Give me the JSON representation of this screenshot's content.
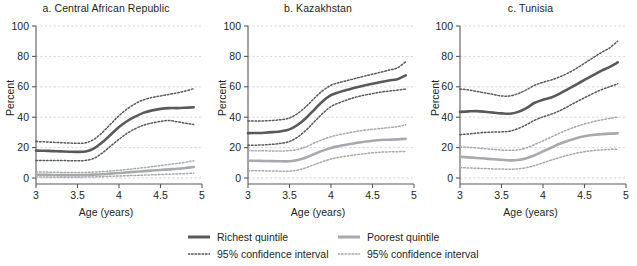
{
  "figure": {
    "ylabel": "Percent",
    "xlabel": "Age (years)",
    "xticks": [
      "3",
      "3.5",
      "4",
      "4.5",
      "5"
    ],
    "yticks": [
      "0",
      "20",
      "40",
      "60",
      "80",
      "100"
    ]
  },
  "legend": {
    "columns": [
      {
        "entries": [
          {
            "label": "Richest quintile",
            "style": "solid",
            "color": "#58595b"
          },
          {
            "label": "95% confidence interval",
            "style": "dotted",
            "color": "#58595b"
          }
        ]
      },
      {
        "entries": [
          {
            "label": "Poorest quintile",
            "style": "solid",
            "color": "#a7a9ac"
          },
          {
            "label": "95% confidence interval",
            "style": "dotted",
            "color": "#a7a9ac"
          }
        ]
      }
    ]
  },
  "colors": {
    "richest": "#58595b",
    "poorest": "#a7a9ac",
    "axis": "#58595b",
    "grid": "#c9c9d4",
    "text": "#231f20"
  },
  "chart_data": [
    {
      "type": "line",
      "title": "a. Central African Republic",
      "xlabel": "Age (years)",
      "ylabel": "Percent",
      "xlim": [
        3,
        5
      ],
      "ylim": [
        0,
        100
      ],
      "xticks": [
        3,
        3.5,
        4,
        4.5,
        5
      ],
      "yticks": [
        0,
        20,
        40,
        60,
        80,
        100
      ],
      "grid": true,
      "legend": "bottom",
      "x": [
        3.0,
        3.1,
        3.2,
        3.3,
        3.4,
        3.5,
        3.6,
        3.7,
        3.8,
        3.9,
        4.0,
        4.1,
        4.2,
        4.3,
        4.4,
        4.5,
        4.6,
        4.7,
        4.8,
        4.9
      ],
      "series": [
        {
          "name": "Richest quintile",
          "style": "solid",
          "color": "#58595b",
          "values": [
            18.0,
            17.9,
            17.7,
            17.5,
            17.3,
            17.2,
            17.5,
            19.5,
            23.5,
            28.5,
            33.5,
            37.5,
            40.5,
            43.0,
            44.5,
            45.5,
            46.0,
            46.0,
            46.2,
            46.5
          ]
        },
        {
          "name": "Richest quintile 95% CI upper",
          "style": "dotted",
          "color": "#58595b",
          "values": [
            24.0,
            23.8,
            23.5,
            23.2,
            23.0,
            22.8,
            23.2,
            25.5,
            30.0,
            35.5,
            41.0,
            45.5,
            49.0,
            51.5,
            53.0,
            54.0,
            55.0,
            56.0,
            57.2,
            58.8
          ]
        },
        {
          "name": "Richest quintile 95% CI lower",
          "style": "dotted",
          "color": "#58595b",
          "values": [
            11.5,
            11.5,
            11.5,
            11.5,
            11.4,
            11.3,
            11.6,
            13.0,
            16.5,
            21.0,
            25.5,
            29.5,
            32.5,
            34.8,
            36.2,
            37.2,
            37.8,
            37.0,
            36.0,
            35.2
          ]
        },
        {
          "name": "Poorest quintile",
          "style": "solid",
          "color": "#a7a9ac",
          "values": [
            2.2,
            2.1,
            2.0,
            1.9,
            1.9,
            1.9,
            2.0,
            2.2,
            2.5,
            2.9,
            3.3,
            3.7,
            4.1,
            4.5,
            4.9,
            5.3,
            5.7,
            6.1,
            6.6,
            7.2
          ]
        },
        {
          "name": "Poorest quintile 95% CI upper",
          "style": "dotted",
          "color": "#a7a9ac",
          "values": [
            4.0,
            3.9,
            3.8,
            3.7,
            3.6,
            3.6,
            3.7,
            3.9,
            4.2,
            4.6,
            5.1,
            5.6,
            6.2,
            6.8,
            7.5,
            8.2,
            8.9,
            9.6,
            10.4,
            11.3
          ]
        },
        {
          "name": "Poorest quintile 95% CI lower",
          "style": "dotted",
          "color": "#a7a9ac",
          "values": [
            0.6,
            0.6,
            0.5,
            0.5,
            0.5,
            0.5,
            0.6,
            0.7,
            0.9,
            1.1,
            1.3,
            1.5,
            1.7,
            1.9,
            2.1,
            2.3,
            2.5,
            2.7,
            2.9,
            3.2
          ]
        }
      ]
    },
    {
      "type": "line",
      "title": "b. Kazakhstan",
      "xlabel": "Age (years)",
      "ylabel": "Percent",
      "xlim": [
        3,
        5
      ],
      "ylim": [
        0,
        100
      ],
      "xticks": [
        3,
        3.5,
        4,
        4.5,
        5
      ],
      "yticks": [
        0,
        20,
        40,
        60,
        80,
        100
      ],
      "grid": true,
      "legend": "bottom",
      "x": [
        3.0,
        3.1,
        3.2,
        3.3,
        3.4,
        3.5,
        3.6,
        3.7,
        3.8,
        3.9,
        4.0,
        4.1,
        4.2,
        4.3,
        4.4,
        4.5,
        4.6,
        4.7,
        4.8,
        4.9
      ],
      "series": [
        {
          "name": "Richest quintile",
          "style": "solid",
          "color": "#58595b",
          "values": [
            29.5,
            29.6,
            29.8,
            30.2,
            30.8,
            32.0,
            35.0,
            39.5,
            45.0,
            50.5,
            54.5,
            56.5,
            58.0,
            59.5,
            60.8,
            62.0,
            63.2,
            64.2,
            65.0,
            67.5
          ]
        },
        {
          "name": "Richest quintile 95% CI upper",
          "style": "dotted",
          "color": "#58595b",
          "values": [
            37.5,
            37.5,
            37.6,
            37.9,
            38.4,
            39.5,
            42.5,
            47.0,
            52.5,
            57.5,
            61.0,
            62.8,
            64.2,
            65.6,
            67.0,
            68.3,
            69.6,
            71.0,
            72.5,
            76.5
          ]
        },
        {
          "name": "Richest quintile 95% CI lower",
          "style": "dotted",
          "color": "#58595b",
          "values": [
            21.5,
            21.6,
            21.8,
            22.2,
            22.8,
            24.0,
            27.0,
            31.5,
            37.0,
            42.5,
            47.0,
            49.5,
            51.5,
            53.2,
            54.5,
            55.5,
            56.5,
            57.2,
            57.8,
            58.5
          ]
        },
        {
          "name": "Poorest quintile",
          "style": "solid",
          "color": "#a7a9ac",
          "values": [
            11.3,
            11.3,
            11.2,
            11.1,
            11.0,
            11.0,
            11.8,
            13.5,
            15.8,
            18.0,
            19.8,
            21.0,
            22.0,
            23.0,
            23.8,
            24.5,
            25.0,
            25.2,
            25.4,
            25.8
          ]
        },
        {
          "name": "Poorest quintile 95% CI upper",
          "style": "dotted",
          "color": "#a7a9ac",
          "values": [
            18.0,
            18.0,
            17.9,
            17.8,
            17.8,
            18.0,
            18.8,
            20.5,
            23.0,
            25.3,
            27.2,
            28.5,
            29.6,
            30.6,
            31.4,
            32.0,
            32.6,
            33.2,
            33.8,
            35.0
          ]
        },
        {
          "name": "Poorest quintile 95% CI lower",
          "style": "dotted",
          "color": "#a7a9ac",
          "values": [
            4.8,
            4.8,
            4.7,
            4.6,
            4.5,
            4.5,
            5.2,
            6.8,
            8.8,
            10.8,
            12.5,
            13.6,
            14.5,
            15.3,
            16.0,
            16.6,
            17.0,
            17.2,
            17.3,
            17.5
          ]
        }
      ]
    },
    {
      "type": "line",
      "title": "c. Tunisia",
      "xlabel": "Age (years)",
      "ylabel": "Percent",
      "xlim": [
        3,
        5
      ],
      "ylim": [
        0,
        100
      ],
      "xticks": [
        3,
        3.5,
        4,
        4.5,
        5
      ],
      "yticks": [
        0,
        20,
        40,
        60,
        80,
        100
      ],
      "grid": true,
      "legend": "bottom",
      "x": [
        3.0,
        3.1,
        3.2,
        3.3,
        3.4,
        3.5,
        3.6,
        3.7,
        3.8,
        3.9,
        4.0,
        4.1,
        4.2,
        4.3,
        4.4,
        4.5,
        4.6,
        4.7,
        4.8,
        4.9
      ],
      "series": [
        {
          "name": "Richest quintile",
          "style": "solid",
          "color": "#58595b",
          "values": [
            43.5,
            43.8,
            44.0,
            43.6,
            43.0,
            42.5,
            42.3,
            43.5,
            46.0,
            49.5,
            51.5,
            53.0,
            55.5,
            58.5,
            61.5,
            64.5,
            67.5,
            70.5,
            73.0,
            76.0
          ]
        },
        {
          "name": "Richest quintile 95% CI upper",
          "style": "dotted",
          "color": "#58595b",
          "values": [
            58.5,
            58.0,
            57.0,
            56.0,
            55.0,
            54.0,
            54.0,
            55.5,
            58.0,
            61.0,
            63.0,
            64.5,
            66.5,
            69.0,
            72.0,
            75.5,
            79.0,
            82.5,
            85.5,
            90.0
          ]
        },
        {
          "name": "Richest quintile 95% CI lower",
          "style": "dotted",
          "color": "#58595b",
          "values": [
            28.5,
            29.0,
            29.5,
            30.0,
            30.2,
            30.3,
            30.8,
            32.5,
            35.0,
            38.0,
            40.2,
            42.0,
            44.2,
            47.0,
            50.0,
            52.8,
            55.5,
            58.0,
            60.0,
            62.0
          ]
        },
        {
          "name": "Poorest quintile",
          "style": "solid",
          "color": "#a7a9ac",
          "values": [
            14.0,
            13.6,
            13.2,
            12.8,
            12.3,
            11.9,
            11.6,
            11.8,
            13.0,
            15.0,
            17.5,
            20.0,
            22.5,
            24.5,
            26.2,
            27.5,
            28.3,
            28.8,
            29.2,
            29.4
          ]
        },
        {
          "name": "Poorest quintile 95% CI upper",
          "style": "dotted",
          "color": "#a7a9ac",
          "values": [
            20.5,
            20.2,
            19.8,
            19.3,
            18.8,
            18.4,
            18.2,
            18.5,
            19.8,
            22.0,
            24.5,
            27.0,
            29.5,
            31.8,
            33.8,
            35.5,
            37.0,
            38.2,
            39.2,
            40.0
          ]
        },
        {
          "name": "Poorest quintile 95% CI lower",
          "style": "dotted",
          "color": "#a7a9ac",
          "values": [
            6.8,
            6.6,
            6.4,
            6.2,
            6.0,
            5.9,
            5.8,
            6.0,
            6.8,
            8.2,
            10.0,
            11.8,
            13.5,
            15.0,
            16.3,
            17.3,
            18.0,
            18.5,
            18.8,
            19.0
          ]
        }
      ]
    }
  ]
}
